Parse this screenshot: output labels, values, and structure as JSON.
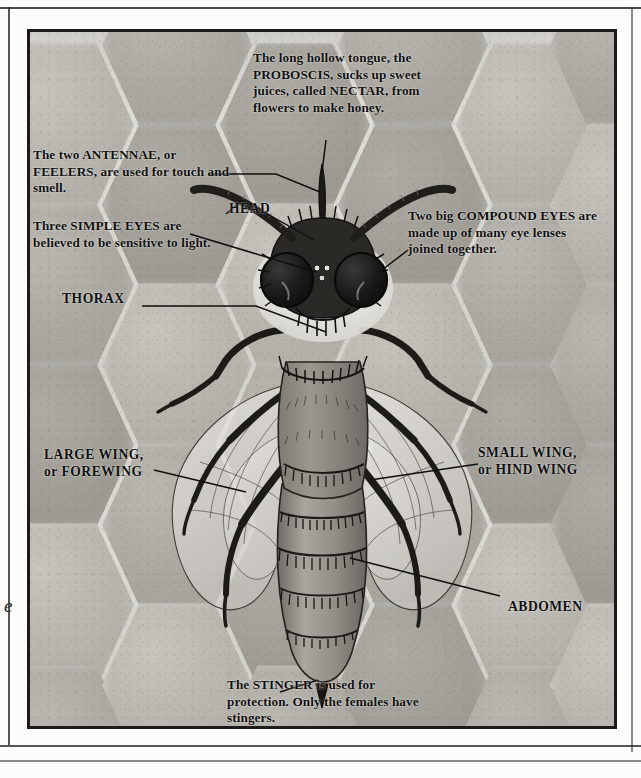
{
  "page": {
    "marginal_letter": "e"
  },
  "diagram": {
    "background": "honeycomb",
    "callouts": [
      {
        "id": "proboscis",
        "text": "The long hollow tongue, the PROBOSCIS, sucks up sweet juices, called NECTAR, from flowers to make honey."
      },
      {
        "id": "antennae",
        "text": "The two ANTENNAE, or FEELERS, are used for touch and smell."
      },
      {
        "id": "simple-eyes",
        "text": "Three SIMPLE EYES are believed to be sensitive to light."
      },
      {
        "id": "compound-eyes",
        "text": "Two big COMPOUND EYES are made up of many eye lenses joined together."
      },
      {
        "id": "stinger",
        "text": "The STINGER is used for protection. Only the females have stingers."
      }
    ],
    "terms": [
      {
        "id": "head",
        "text": "HEAD"
      },
      {
        "id": "thorax",
        "text": "THORAX"
      },
      {
        "id": "large-wing",
        "line1": "LARGE WING,",
        "line2": "or FOREWING"
      },
      {
        "id": "small-wing",
        "line1": "SMALL WING,",
        "line2": "or HIND WING"
      },
      {
        "id": "abdomen",
        "text": "ABDOMEN"
      }
    ],
    "colors": {
      "ink": "#100f0e",
      "comb_light": "#dedcd6",
      "comb_mid": "#c6c4bd",
      "comb_dark": "#aeaca5",
      "bee_body": "#8e8b85",
      "bee_dark": "#2a2825"
    }
  }
}
